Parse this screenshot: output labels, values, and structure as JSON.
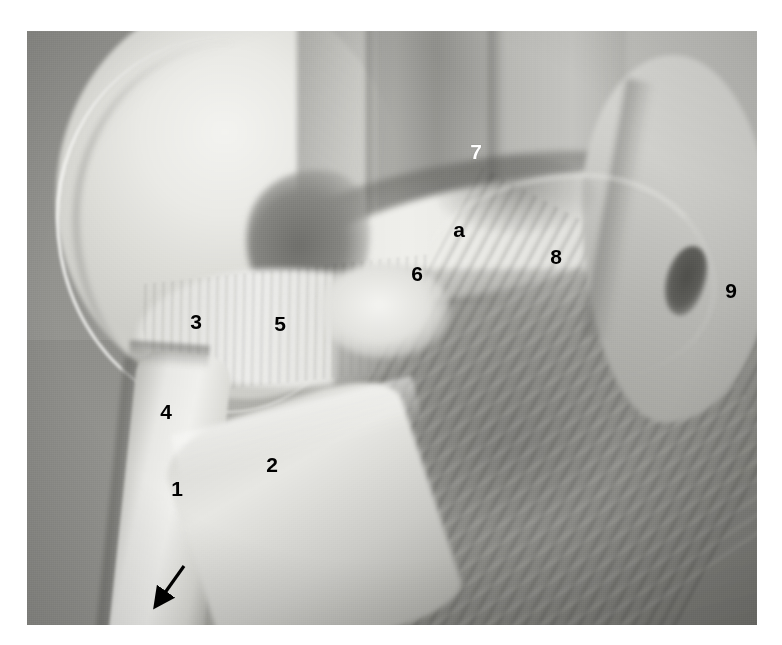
{
  "figure": {
    "kind": "anatomical-dissection-photograph",
    "modality": "black-and-white photograph",
    "caption": "",
    "background_color": "#ffffff",
    "photo": {
      "x": 27,
      "y": 31,
      "width": 730,
      "height": 594,
      "tone_range": "grayscale",
      "base_color": "#b8b8b4"
    }
  },
  "labels": [
    {
      "id": "label-1",
      "text": "1",
      "x": 177,
      "y": 488,
      "color": "#000000",
      "style": "dark"
    },
    {
      "id": "label-2",
      "text": "2",
      "x": 272,
      "y": 464,
      "color": "#000000",
      "style": "dark"
    },
    {
      "id": "label-3",
      "text": "3",
      "x": 196,
      "y": 321,
      "color": "#000000",
      "style": "dark"
    },
    {
      "id": "label-4",
      "text": "4",
      "x": 166,
      "y": 411,
      "color": "#000000",
      "style": "dark"
    },
    {
      "id": "label-5",
      "text": "5",
      "x": 280,
      "y": 323,
      "color": "#000000",
      "style": "dark"
    },
    {
      "id": "label-6",
      "text": "6",
      "x": 417,
      "y": 273,
      "color": "#000000",
      "style": "dark"
    },
    {
      "id": "label-7",
      "text": "7",
      "x": 476,
      "y": 151,
      "color": "#ffffff",
      "style": "light"
    },
    {
      "id": "label-8",
      "text": "8",
      "x": 556,
      "y": 256,
      "color": "#000000",
      "style": "dark"
    },
    {
      "id": "label-9",
      "text": "9",
      "x": 731,
      "y": 290,
      "color": "#000000",
      "style": "dark"
    },
    {
      "id": "label-a",
      "text": "a",
      "x": 459,
      "y": 229,
      "color": "#000000",
      "style": "dark"
    }
  ],
  "arrow": {
    "id": "direction-arrow",
    "color": "#000000",
    "tail_x": 184,
    "tail_y": 566,
    "head_x": 152,
    "head_y": 611,
    "description": "solid black arrow pointing down and to the left"
  }
}
